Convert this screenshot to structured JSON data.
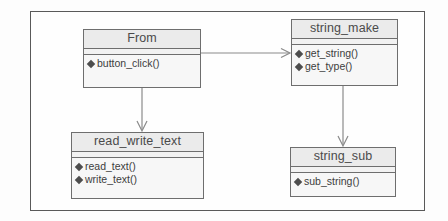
{
  "diagram": {
    "kind": "uml-class-diagram",
    "frame_border_color": "#595959",
    "background_color": "#fdfdfd",
    "classes": [
      {
        "id": "from",
        "name": "From",
        "attributes": [],
        "methods": [
          {
            "bullet": "diamond-bullet-icon",
            "label": "button_click()"
          }
        ]
      },
      {
        "id": "string_make",
        "name": "string_make",
        "attributes": [],
        "methods": [
          {
            "bullet": "diamond-bullet-icon",
            "label": "get_string()"
          },
          {
            "bullet": "diamond-bullet-icon",
            "label": "get_type()"
          }
        ]
      },
      {
        "id": "read_write_text",
        "name": "read_write_text",
        "attributes": [],
        "methods": [
          {
            "bullet": "diamond-bullet-icon",
            "label": "read_text()"
          },
          {
            "bullet": "diamond-bullet-icon",
            "label": "write_text()"
          }
        ]
      },
      {
        "id": "string_sub",
        "name": "string_sub",
        "attributes": [],
        "methods": [
          {
            "bullet": "diamond-bullet-icon",
            "label": "sub_string()"
          }
        ]
      }
    ],
    "connectors": [
      {
        "id": "from-to-string-make",
        "from": "From",
        "to": "string_make",
        "type": "dependency",
        "arrowhead": "open",
        "orientation": "horizontal"
      },
      {
        "id": "from-to-read-write-text",
        "from": "From",
        "to": "read_write_text",
        "type": "dependency",
        "arrowhead": "open",
        "orientation": "vertical"
      },
      {
        "id": "string-make-to-string-sub",
        "from": "string_make",
        "to": "string_sub",
        "type": "dependency",
        "arrowhead": "open",
        "orientation": "vertical"
      }
    ],
    "line_color": "#8a8a8a",
    "class_header_fill": "#ebebeb",
    "class_body_fill": "#f7f7f7",
    "class_border_color": "#6e6e6e"
  }
}
